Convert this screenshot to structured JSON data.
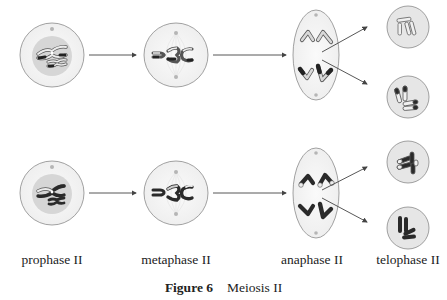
{
  "figure": {
    "number_label": "Figure 6",
    "title": "Meiosis II"
  },
  "stages": [
    {
      "id": "prophase",
      "label": "prophase II"
    },
    {
      "id": "metaphase",
      "label": "metaphase II"
    },
    {
      "id": "anaphase",
      "label": "anaphase II"
    },
    {
      "id": "telophase",
      "label": "telophase II"
    }
  ],
  "rows": [
    {
      "name": "top-lineage",
      "daughter_cells": 2
    },
    {
      "name": "bottom-lineage",
      "daughter_cells": 2
    }
  ],
  "colors": {
    "cell_outline": "#8a8a8a",
    "nucleus_fill": "#d9d9d9",
    "cytoplasm_fill": "#f4f4f4",
    "chromosome_dark": "#2a2a2a",
    "chromosome_light": "#ececec",
    "chromosome_outline": "#555555",
    "arrow": "#444444",
    "centriole": "#b0b0b0"
  }
}
